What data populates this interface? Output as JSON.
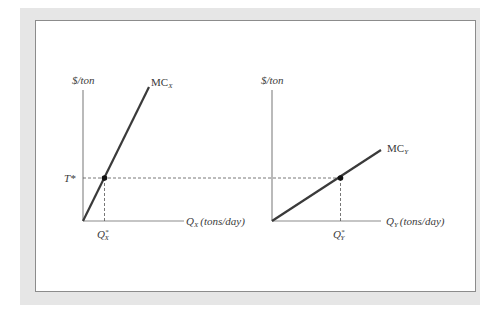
{
  "figure": {
    "left_panel": {
      "y_axis_label": "$/ton",
      "curve_label": "MC",
      "curve_subscript": "X",
      "x_axis_label_main": "Q",
      "x_axis_label_sub": "X",
      "x_axis_units": "(tons/day)",
      "equilibrium_x_label": "Q",
      "equilibrium_x_sup": "*",
      "equilibrium_x_sub": "X",
      "tax_label": "T*"
    },
    "right_panel": {
      "y_axis_label": "$/ton",
      "curve_label": "MC",
      "curve_subscript": "Y",
      "x_axis_label_main": "Q",
      "x_axis_label_sub": "Y",
      "x_axis_units": "(tons/day)",
      "equilibrium_x_label": "Q",
      "equilibrium_x_sup": "*",
      "equilibrium_x_sub": "Y"
    },
    "colors": {
      "axis": "#8c8c8c",
      "curve": "#3a3a3a",
      "dashed": "#555555",
      "point": "#111111",
      "frame": "#e6e6e6"
    }
  }
}
